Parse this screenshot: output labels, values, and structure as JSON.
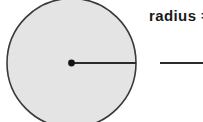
{
  "page": {
    "background_color": "#ffffff",
    "width": 203,
    "height": 122
  },
  "figure": {
    "name": "circle-with-radius",
    "shape": "circle",
    "fill_color": "#e4e4e4",
    "stroke_color": "#3a3a3a",
    "stroke_width": 1.6,
    "center_x": 71.5,
    "center_y": 63,
    "radius": 64.5,
    "clipped_top": true,
    "clipped_bottom": true,
    "center_dot": {
      "name": "center-point",
      "x": 71.5,
      "y": 63,
      "r": 3.4,
      "color": "#141414"
    },
    "radius_segment": {
      "name": "radius-line",
      "x1": 71.5,
      "y1": 63,
      "x2": 136,
      "y2": 63,
      "color": "#2b2b2b",
      "width": 2
    }
  },
  "question": {
    "prompt_label": "radius  =",
    "answer_value": "",
    "answer_placeholder": ""
  }
}
